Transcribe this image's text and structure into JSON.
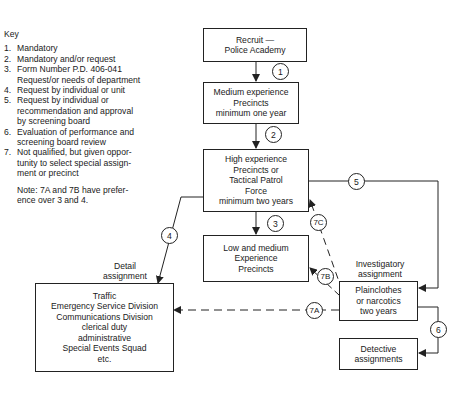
{
  "key": {
    "title": "Key",
    "items": [
      {
        "num": "1.",
        "text": "Mandatory"
      },
      {
        "num": "2.",
        "text": "Mandatory and/or request"
      },
      {
        "num": "3.",
        "text": "Form Number P.D. 406-041\nRequest/or needs of department"
      },
      {
        "num": "4.",
        "text": "Request by individual or unit"
      },
      {
        "num": "5.",
        "text": "Request by individual or\nrecommendation and approval\nby screening board"
      },
      {
        "num": "6.",
        "text": "Evaluation of performance and\nscreening board review"
      },
      {
        "num": "7.",
        "text": "Not qualified, but given oppor-\ntunity to select special assign-\nment or precinct"
      }
    ],
    "note": "Note: 7A and 7B have prefer-\n         ence over 3 and 4."
  },
  "boxes": {
    "recruit": "Recruit —\nPolice Academy",
    "medium": "Medium experience\nPrecincts\nminimum one year",
    "high": "High experience\nPrecincts or\nTactical Patrol\nForce\nminimum two years",
    "low_medium": "Low and medium\nExperience\nPrecincts",
    "detail": "Traffic\nEmergency Service Division\nCommunications Division\nclerical duty\nadministrative\nSpecial Events Squad\netc.",
    "plainclothes": "Plainclothes\nor narcotics\ntwo years",
    "detective": "Detective\nassignments"
  },
  "labels": {
    "detail_assignment": "Detail\nassignment",
    "investigatory_assignment": "Investigatory\nassignment"
  },
  "circles": {
    "c1": "1",
    "c2": "2",
    "c3": "3",
    "c4": "4",
    "c5": "5",
    "c6": "6",
    "c7a": "7A",
    "c7b": "7B",
    "c7c": "7C"
  }
}
